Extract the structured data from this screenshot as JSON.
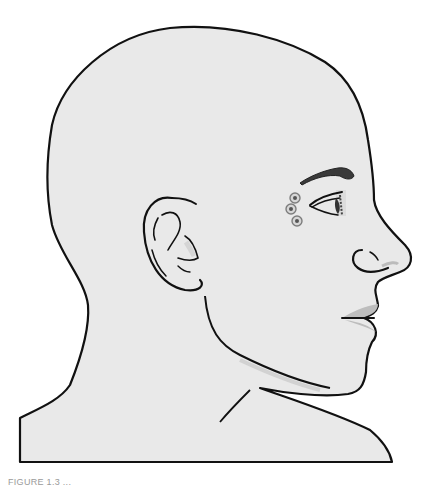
{
  "figure": {
    "colors": {
      "skin": "#e9e9e9",
      "outline": "#111111",
      "shadow": "#c8c8c8",
      "brow": "#3a3a3a",
      "marker_ring": "#8a8a8a",
      "marker_center": "#555555",
      "lip": "#bdbdbd"
    },
    "markers": [
      {
        "id": "point-1",
        "cx": 295,
        "cy": 198
      },
      {
        "id": "point-2",
        "cx": 292,
        "cy": 209
      },
      {
        "id": "point-3",
        "cx": 297,
        "cy": 221
      }
    ]
  },
  "caption": {
    "text": "FIGURE 1.3 ..."
  }
}
